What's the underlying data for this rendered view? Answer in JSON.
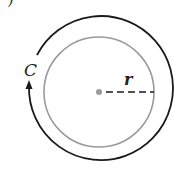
{
  "diagram": {
    "part_label": ")",
    "circumference_label": "C",
    "radius_label": "r",
    "colors": {
      "outer_arc": "#1a1a1a",
      "inner_circle": "#9a9a9a",
      "center_dot": "#9a9a9a",
      "radius_line": "#1a1a1a"
    }
  }
}
